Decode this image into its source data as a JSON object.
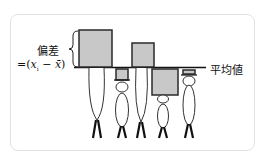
{
  "top_fragment": "・…",
  "labels": {
    "deviation": "偏差",
    "formula_prefix": "=(",
    "formula_x": "x",
    "formula_sub": "i",
    "formula_minus": " − ",
    "formula_xbar": "x̄",
    "formula_suffix": ")",
    "mean": "平均値"
  },
  "colors": {
    "box_fill": "#c8c8c8",
    "box_stroke": "#2a2a2a",
    "line": "#111111",
    "frame": "#e2e2e2"
  },
  "people": [
    {
      "name": "person-1",
      "height": "tall",
      "deviation_direction": "above",
      "relative_deviation": 1.0
    },
    {
      "name": "person-2",
      "height": "short",
      "deviation_direction": "below",
      "relative_deviation": 0.32
    },
    {
      "name": "person-3",
      "height": "tall",
      "deviation_direction": "above",
      "relative_deviation": 0.65
    },
    {
      "name": "person-4",
      "height": "short",
      "deviation_direction": "below",
      "relative_deviation": 0.7
    },
    {
      "name": "person-5",
      "height": "tall",
      "deviation_direction": "below",
      "relative_deviation": 0.14
    }
  ]
}
